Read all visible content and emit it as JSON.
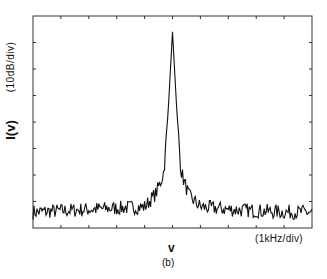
{
  "chart_data": {
    "type": "line",
    "title": "",
    "caption": "(b)",
    "xlabel": "v",
    "ylabel": "I(v)",
    "x_units": "(1kHz/div)",
    "y_units": "(10dB/div)",
    "x_divisions": 10,
    "y_divisions": 8,
    "grid": false,
    "legend": null,
    "xlim": [
      -5,
      5
    ],
    "ylim": [
      0,
      8
    ],
    "peak": {
      "x": 0,
      "y": 7.4
    },
    "noise_floor": 0.6,
    "series": [
      {
        "name": "spectrum",
        "x": [
          -5,
          -4,
          -3,
          -2,
          -1,
          -0.6,
          -0.4,
          -0.3,
          -0.15,
          0,
          0.15,
          0.3,
          0.4,
          0.6,
          1,
          2,
          3,
          4,
          5
        ],
        "y": [
          0.6,
          0.65,
          0.7,
          0.75,
          0.8,
          1.3,
          1.8,
          2.2,
          4.5,
          7.4,
          4.5,
          2.2,
          1.8,
          1.2,
          0.8,
          0.7,
          0.65,
          0.6,
          0.6
        ]
      }
    ]
  },
  "labels": {
    "y_units": "(10dB/div)",
    "y_axis": "I(v)",
    "x_units": "(1kHz/div)",
    "x_axis": "v",
    "caption": "(b)"
  },
  "colors": {
    "line": "#111111",
    "frame": "#333333",
    "background": "#ffffff"
  }
}
